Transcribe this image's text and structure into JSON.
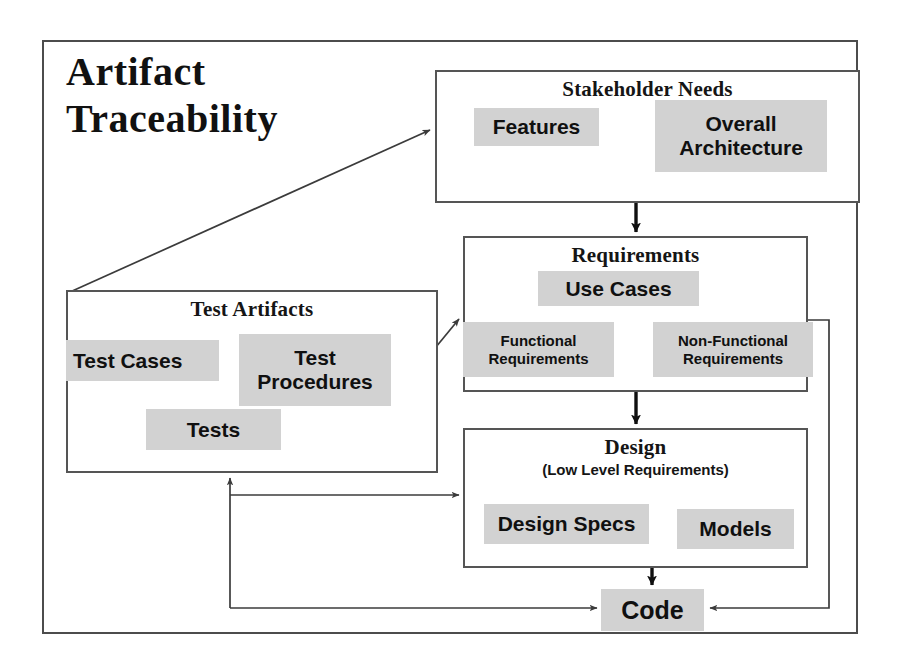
{
  "diagram": {
    "title": "Artifact\nTraceability",
    "title_line1": "Artifact",
    "title_line2": "Traceability",
    "colors": {
      "chip_fill": "#d2d2d2",
      "box_stroke": "#555555",
      "frame_stroke": "#4c4c4c",
      "text": "#101010",
      "background": "#ffffff"
    },
    "nodes": [
      {
        "id": "stakeholder-needs",
        "title": "Stakeholder Needs",
        "subtitle": "",
        "chips": [
          "Features",
          "Overall\nArchitecture"
        ]
      },
      {
        "id": "requirements",
        "title": "Requirements",
        "subtitle": "",
        "chips": [
          "Use Cases",
          "Functional\nRequirements",
          "Non-Functional\nRequirements"
        ]
      },
      {
        "id": "test-artifacts",
        "title": "Test Artifacts",
        "subtitle": "",
        "chips": [
          "Test Cases",
          "Test\nProcedures",
          "Tests"
        ]
      },
      {
        "id": "design",
        "title": "Design",
        "subtitle": "(Low Level Requirements)",
        "chips": [
          "Design Specs",
          "Models"
        ]
      },
      {
        "id": "code",
        "title": "Code",
        "subtitle": "",
        "chips": []
      }
    ],
    "labels": {
      "stakeholder_title": "Stakeholder Needs",
      "stakeholder_features": "Features",
      "stakeholder_architecture": "Overall\nArchitecture",
      "requirements_title": "Requirements",
      "requirements_usecases": "Use Cases",
      "requirements_functional": "Functional\nRequirements",
      "requirements_nonfunctional": "Non-Functional\nRequirements",
      "testartifacts_title": "Test Artifacts",
      "testartifacts_testcases": "Test Cases",
      "testartifacts_testprocedures": "Test\nProcedures",
      "testartifacts_tests": "Tests",
      "design_title": "Design",
      "design_subtitle": "(Low Level Requirements)",
      "design_specs": "Design Specs",
      "design_models": "Models",
      "code_label": "Code"
    },
    "edges": [
      {
        "id": "testartifacts-to-stakeholder",
        "from": "test-artifacts",
        "to": "stakeholder-needs",
        "style": "thin-diagonal"
      },
      {
        "id": "stakeholder-to-requirements",
        "from": "stakeholder-needs",
        "to": "requirements",
        "style": "thick-vertical"
      },
      {
        "id": "testartifacts-to-requirements",
        "from": "test-artifacts",
        "to": "requirements",
        "style": "thin-diagonal"
      },
      {
        "id": "requirements-to-design",
        "from": "requirements",
        "to": "design",
        "style": "thick-vertical"
      },
      {
        "id": "design-to-code",
        "from": "design",
        "to": "code",
        "style": "thick-vertical"
      },
      {
        "id": "design-to-testartifacts",
        "from": "design",
        "to": "test-artifacts",
        "style": "thin-orthogonal"
      },
      {
        "id": "code-to-testartifacts",
        "from": "code",
        "to": "test-artifacts",
        "style": "thin-orthogonal"
      },
      {
        "id": "requirements-to-code",
        "from": "requirements",
        "to": "code",
        "style": "thin-orthogonal"
      }
    ]
  }
}
